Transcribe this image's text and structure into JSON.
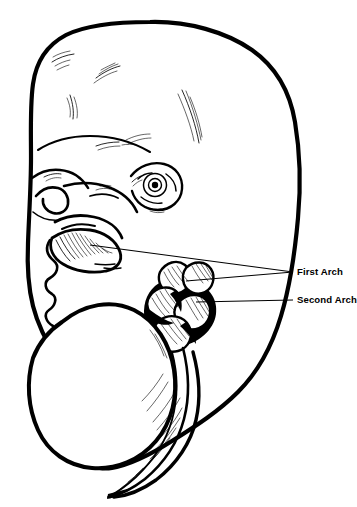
{
  "figure": {
    "kind": "anatomical-line-drawing",
    "background_color": "#ffffff",
    "ink_color": "#000000",
    "width": 357,
    "height": 507
  },
  "labels": [
    {
      "id": "first-arch",
      "text": "First Arch",
      "x": 297,
      "y": 272
    },
    {
      "id": "second-arch",
      "text": "Second Arch",
      "x": 297,
      "y": 300
    }
  ],
  "leaders": [
    {
      "id": "first-arch-leader-mandible",
      "from_label": "First Arch",
      "points": "90,245 293,272"
    },
    {
      "id": "first-arch-leader-arch",
      "from_label": "First Arch",
      "points": "186,281 293,272"
    },
    {
      "id": "second-arch-leader",
      "from_label": "Second Arch",
      "points": "196,302 293,300"
    }
  ],
  "anatomy_parts": [
    {
      "id": "cranial-vault",
      "name": "Cranial vault / forebrain prominence"
    },
    {
      "id": "frontonasal-prominence",
      "name": "Frontonasal prominence with nostril"
    },
    {
      "id": "eye",
      "name": "Developing eye"
    },
    {
      "id": "maxillary-prominence",
      "name": "Maxillary prominence"
    },
    {
      "id": "mandibular-prominence",
      "name": "Mandibular prominence (first arch)"
    },
    {
      "id": "pharyngeal-arches",
      "name": "Pharyngeal arch lobes"
    },
    {
      "id": "heart-prominence",
      "name": "Heart / chest prominence"
    },
    {
      "id": "caudal-tail",
      "name": "Caudal tail region"
    }
  ]
}
